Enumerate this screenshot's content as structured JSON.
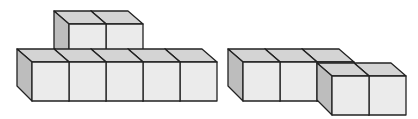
{
  "diagram": {
    "colors": {
      "front": "#ebebeb",
      "top": "#d4d4d4",
      "side": "#bdbdbd",
      "stroke": "#222222",
      "background": "#ffffff"
    },
    "cube_size": 37,
    "depth_offset": [
      -15,
      -13
    ],
    "figures": [
      {
        "name": "left-figure",
        "cube_count": 7,
        "cubes": [
          {
            "x": 32,
            "y": 62
          },
          {
            "x": 69,
            "y": 62
          },
          {
            "x": 106,
            "y": 62
          },
          {
            "x": 143,
            "y": 62
          },
          {
            "x": 180,
            "y": 62
          },
          {
            "x": 69,
            "y": 24
          },
          {
            "x": 106,
            "y": 24
          }
        ]
      },
      {
        "name": "right-figure",
        "cube_count": 5,
        "cubes": [
          {
            "x": 243,
            "y": 62
          },
          {
            "x": 280,
            "y": 62
          },
          {
            "x": 317,
            "y": 62
          },
          {
            "x": 332,
            "y": 76
          },
          {
            "x": 369,
            "y": 76
          }
        ]
      }
    ]
  }
}
